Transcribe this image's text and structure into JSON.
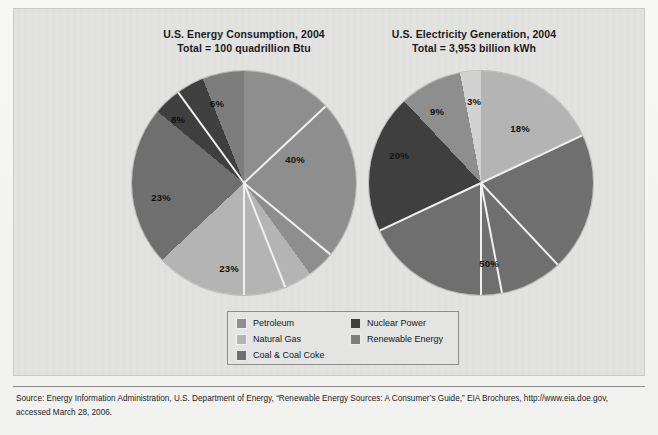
{
  "figure": {
    "background_color": "#e2e2e1",
    "page_color": "#f5f5f4"
  },
  "charts": [
    {
      "id": "energy-consumption",
      "title_line1": "U.S. Energy Consumption, 2004",
      "title_line2": "Total = 100 quadrillion Btu"
    },
    {
      "id": "electricity-generation",
      "title_line1": "U.S. Electricity Generation, 2004",
      "title_line2": "Total = 3,953 billion kWh"
    }
  ],
  "legend": {
    "left_column": [
      {
        "label": "Petroleum",
        "color": "#8e8e8e"
      },
      {
        "label": "Natural Gas",
        "color": "#b4b4b4"
      },
      {
        "label": "Coal & Coal Coke",
        "color": "#6f6f6f"
      }
    ],
    "right_column": [
      {
        "label": "Nuclear Power",
        "color": "#3f3f3f"
      },
      {
        "label": "Renewable Energy",
        "color": "#7d7d7d"
      }
    ]
  },
  "source": {
    "line1": "Source: Energy Information Administration, U.S. Department of Energy, “Renewable Energy Sources: A Consumer’s Guide,” EIA Brochures, http://www.eia.doe.gov,",
    "line2": "accessed March 28, 2006."
  },
  "chart_data": [
    {
      "type": "pie",
      "title": "U.S. Energy Consumption, 2004",
      "subtitle": "Total = 100 quadrillion Btu",
      "total": "100 quadrillion Btu",
      "unit": "percent",
      "start_angle_deg": 0,
      "direction": "clockwise",
      "categories": [
        "Petroleum",
        "Natural Gas",
        "Coal & Coal Coke",
        "Nuclear Power",
        "Renewable Energy"
      ],
      "values": [
        40,
        23,
        23,
        8,
        6
      ],
      "labels": [
        "40%",
        "23%",
        "23%",
        "8%",
        "6%"
      ],
      "colors": [
        "#8e8e8e",
        "#b4b4b4",
        "#6f6f6f",
        "#3f3f3f",
        "#7d7d7d"
      ],
      "label_positions": [
        {
          "text": "40%",
          "x": 163,
          "y": 88
        },
        {
          "text": "23%",
          "x": 97,
          "y": 197
        },
        {
          "text": "23%",
          "x": 29,
          "y": 126
        },
        {
          "text": "8%",
          "x": 46,
          "y": 48
        },
        {
          "text": "6%",
          "x": 85,
          "y": 32
        }
      ]
    },
    {
      "type": "pie",
      "title": "U.S. Electricity Generation, 2004",
      "subtitle": "Total = 3,953 billion kWh",
      "total": "3,953 billion kWh",
      "unit": "percent",
      "start_angle_deg": 0,
      "direction": "clockwise",
      "categories": [
        "Natural Gas",
        "Coal & Coal Coke",
        "Nuclear Power",
        "Renewable Energy",
        "Petroleum"
      ],
      "values": [
        18,
        50,
        20,
        9,
        3
      ],
      "labels": [
        "18%",
        "50%",
        "20%",
        "9%",
        "3%"
      ],
      "colors": [
        "#b4b4b4",
        "#6f6f6f",
        "#3f3f3f",
        "#8e8e8e",
        "#d2d2d2"
      ],
      "label_positions": [
        {
          "text": "18%",
          "x": 151,
          "y": 57
        },
        {
          "text": "50%",
          "x": 120,
          "y": 192
        },
        {
          "text": "20%",
          "x": 30,
          "y": 84
        },
        {
          "text": "9%",
          "x": 68,
          "y": 40
        },
        {
          "text": "3%",
          "x": 105,
          "y": 30
        }
      ]
    }
  ]
}
